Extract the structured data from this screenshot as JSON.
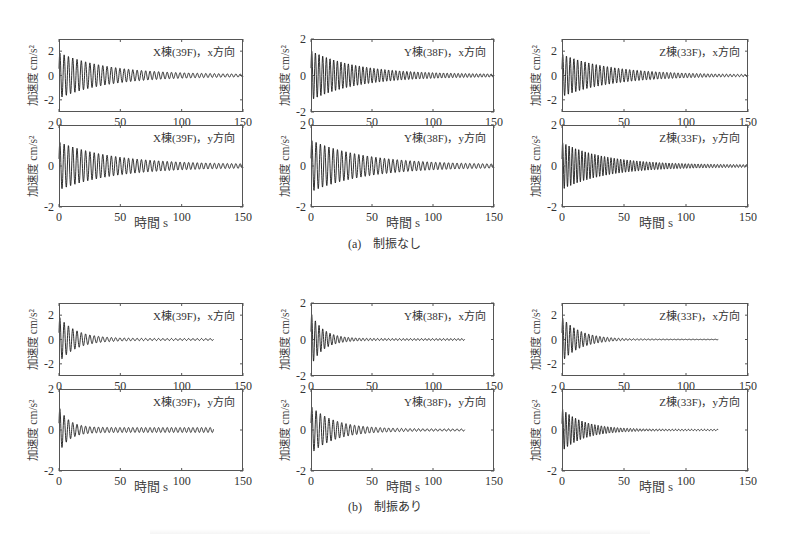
{
  "figure": {
    "groups": [
      {
        "label": "(a)",
        "title": "制振なし",
        "caption": "(a)　制振なし"
      },
      {
        "label": "(b)",
        "title": "制振あり",
        "caption": "(b)　制振あり"
      }
    ],
    "xlabel": "時間 s",
    "ylabel": "加速度 cm/s²",
    "line_color": "#1a1a1a",
    "frame_color": "#555555"
  },
  "chart_data": [
    {
      "type": "line",
      "group": "(a) 制振なし",
      "title": "X棟(39F)，x方向",
      "xlabel": "時間 s",
      "ylabel": "加速度 cm/s²",
      "xlim": [
        0,
        150
      ],
      "ylim": [
        -3,
        3
      ],
      "xticks": [
        0,
        50,
        100,
        150
      ],
      "yticks": [
        -2,
        0,
        2
      ],
      "grid": false,
      "series": [
        {
          "name": "acceleration",
          "kind": "decaying_sine",
          "peak_amplitude": 1.8,
          "period_s": 3.5,
          "decay_time_s": 40,
          "duration_s": 150,
          "residual": 0.08
        }
      ]
    },
    {
      "type": "line",
      "group": "(a) 制振なし",
      "title": "Y棟(38F)，x方向",
      "xlabel": "時間 s",
      "ylabel": "加速度 cm/s²",
      "xlim": [
        0,
        150
      ],
      "ylim": [
        -2,
        2
      ],
      "xticks": [
        0,
        50,
        100,
        150
      ],
      "yticks": [
        -2,
        0,
        2
      ],
      "grid": false,
      "series": [
        {
          "name": "acceleration",
          "kind": "decaying_sine",
          "peak_amplitude": 1.3,
          "period_s": 3.0,
          "decay_time_s": 38,
          "duration_s": 150,
          "residual": 0.06
        }
      ]
    },
    {
      "type": "line",
      "group": "(a) 制振なし",
      "title": "Z棟(33F)，x方向",
      "xlabel": "時間 s",
      "ylabel": "加速度 cm/s²",
      "xlim": [
        0,
        150
      ],
      "ylim": [
        -3,
        3
      ],
      "xticks": [
        0,
        50,
        100,
        150
      ],
      "yticks": [
        -2,
        0,
        2
      ],
      "grid": false,
      "series": [
        {
          "name": "acceleration",
          "kind": "decaying_sine",
          "peak_amplitude": 1.7,
          "period_s": 3.0,
          "decay_time_s": 40,
          "duration_s": 150,
          "residual": 0.05
        }
      ]
    },
    {
      "type": "line",
      "group": "(a) 制振なし",
      "title": "X棟(39F)，y方向",
      "xlabel": "時間 s",
      "ylabel": "加速度 cm/s²",
      "xlim": [
        0,
        150
      ],
      "ylim": [
        -2,
        2
      ],
      "xticks": [
        0,
        50,
        100,
        150
      ],
      "yticks": [
        -2,
        0,
        2
      ],
      "grid": false,
      "series": [
        {
          "name": "acceleration",
          "kind": "decaying_sine",
          "peak_amplitude": 1.1,
          "period_s": 3.5,
          "decay_time_s": 45,
          "duration_s": 150,
          "residual": 0.07
        }
      ]
    },
    {
      "type": "line",
      "group": "(a) 制振なし",
      "title": "Y棟(38F)，y方向",
      "xlabel": "時間 s",
      "ylabel": "加速度 cm/s²",
      "xlim": [
        0,
        150
      ],
      "ylim": [
        -2,
        2
      ],
      "xticks": [
        0,
        50,
        100,
        150
      ],
      "yticks": [
        -2,
        0,
        2
      ],
      "grid": false,
      "series": [
        {
          "name": "acceleration",
          "kind": "decaying_sine",
          "peak_amplitude": 1.2,
          "period_s": 3.5,
          "decay_time_s": 45,
          "duration_s": 150,
          "residual": 0.06
        }
      ]
    },
    {
      "type": "line",
      "group": "(a) 制振なし",
      "title": "Z棟(33F)，y方向",
      "xlabel": "時間 s",
      "ylabel": "加速度 cm/s²",
      "xlim": [
        0,
        150
      ],
      "ylim": [
        -2,
        2
      ],
      "xticks": [
        0,
        50,
        100,
        150
      ],
      "yticks": [
        -2,
        0,
        2
      ],
      "grid": false,
      "series": [
        {
          "name": "acceleration",
          "kind": "decaying_sine",
          "peak_amplitude": 1.1,
          "period_s": 2.6,
          "decay_time_s": 35,
          "duration_s": 150,
          "residual": 0.05
        }
      ]
    },
    {
      "type": "line",
      "group": "(b) 制振あり",
      "title": "X棟(39F)，x方向",
      "xlabel": "時間 s",
      "ylabel": "加速度 cm/s²",
      "xlim": [
        0,
        150
      ],
      "ylim": [
        -3,
        3
      ],
      "xticks": [
        0,
        50,
        100,
        150
      ],
      "yticks": [
        -2,
        0,
        2
      ],
      "grid": false,
      "series": [
        {
          "name": "acceleration",
          "kind": "decaying_sine",
          "peak_amplitude": 1.8,
          "period_s": 3.5,
          "decay_time_s": 14,
          "duration_s": 126,
          "residual": 0.08
        }
      ]
    },
    {
      "type": "line",
      "group": "(b) 制振あり",
      "title": "Y棟(38F)，x方向",
      "xlabel": "時間 s",
      "ylabel": "加速度 cm/s²",
      "xlim": [
        0,
        150
      ],
      "ylim": [
        -2,
        2
      ],
      "xticks": [
        0,
        50,
        100,
        150
      ],
      "yticks": [
        -2,
        0,
        2
      ],
      "grid": false,
      "series": [
        {
          "name": "acceleration",
          "kind": "decaying_sine",
          "peak_amplitude": 1.4,
          "period_s": 3.0,
          "decay_time_s": 10,
          "duration_s": 126,
          "residual": 0.05
        }
      ]
    },
    {
      "type": "line",
      "group": "(b) 制振あり",
      "title": "Z棟(33F)，x方向",
      "xlabel": "時間 s",
      "ylabel": "加速度 cm/s²",
      "xlim": [
        0,
        150
      ],
      "ylim": [
        -3,
        3
      ],
      "xticks": [
        0,
        50,
        100,
        150
      ],
      "yticks": [
        -2,
        0,
        2
      ],
      "grid": false,
      "series": [
        {
          "name": "acceleration",
          "kind": "decaying_sine",
          "peak_amplitude": 1.8,
          "period_s": 3.0,
          "decay_time_s": 15,
          "duration_s": 126,
          "residual": 0.02
        }
      ]
    },
    {
      "type": "line",
      "group": "(b) 制振あり",
      "title": "X棟(39F)，y方向",
      "xlabel": "時間 s",
      "ylabel": "加速度 cm/s²",
      "xlim": [
        0,
        150
      ],
      "ylim": [
        -2,
        2
      ],
      "xticks": [
        0,
        50,
        100,
        150
      ],
      "yticks": [
        -2,
        0,
        2
      ],
      "grid": false,
      "series": [
        {
          "name": "acceleration",
          "kind": "decaying_sine",
          "peak_amplitude": 1.0,
          "period_s": 3.5,
          "decay_time_s": 8,
          "duration_s": 126,
          "residual": 0.12
        }
      ]
    },
    {
      "type": "line",
      "group": "(b) 制振あり",
      "title": "Y棟(38F)，y方向",
      "xlabel": "時間 s",
      "ylabel": "加速度 cm/s²",
      "xlim": [
        0,
        150
      ],
      "ylim": [
        -2,
        2
      ],
      "xticks": [
        0,
        50,
        100,
        150
      ],
      "yticks": [
        -2,
        0,
        2
      ],
      "grid": false,
      "series": [
        {
          "name": "acceleration",
          "kind": "decaying_sine",
          "peak_amplitude": 1.1,
          "period_s": 3.5,
          "decay_time_s": 20,
          "duration_s": 126,
          "residual": 0.05
        }
      ]
    },
    {
      "type": "line",
      "group": "(b) 制振あり",
      "title": "Z棟(33F)，y方向",
      "xlabel": "時間 s",
      "ylabel": "加速度 cm/s²",
      "xlim": [
        0,
        150
      ],
      "ylim": [
        -2,
        2
      ],
      "xticks": [
        0,
        50,
        100,
        150
      ],
      "yticks": [
        -2,
        0,
        2
      ],
      "grid": false,
      "series": [
        {
          "name": "acceleration",
          "kind": "decaying_sine",
          "peak_amplitude": 1.0,
          "period_s": 2.6,
          "decay_time_s": 18,
          "duration_s": 126,
          "residual": 0.03
        }
      ]
    }
  ]
}
